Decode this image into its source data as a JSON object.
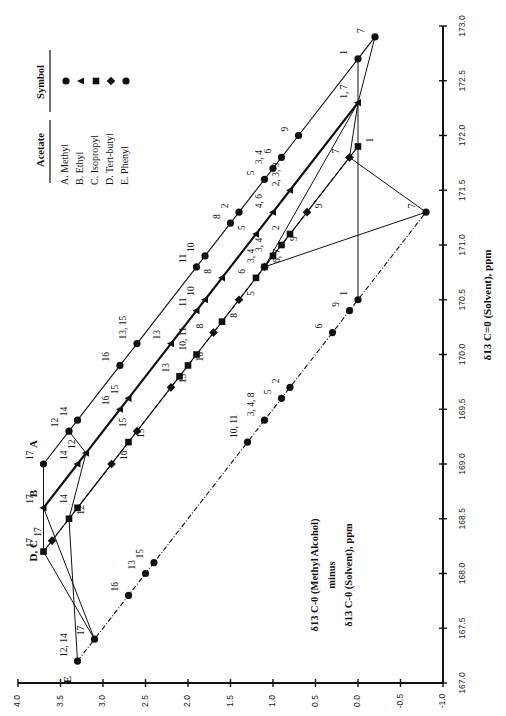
{
  "chart_data": {
    "type": "scatter",
    "orientation": "rotated-90-ccw",
    "title": "",
    "xlabel": "δ13 C=0 (Solvent), ppm",
    "ylabel": "δ13 C=0 (Methyl Alcohol) minus δ13 C=0 (Solvent), ppm",
    "xlim": [
      167.0,
      173.0
    ],
    "ylim": [
      -1.0,
      4.0
    ],
    "x_ticks": [
      "167.0",
      "167.5",
      "168.0",
      "168.5",
      "169.0",
      "169.5",
      "170.0",
      "170.5",
      "171.0",
      "171.5",
      "172.0",
      "172.5",
      "173.0"
    ],
    "y_ticks": [
      "4.0",
      "3.5",
      "3.0",
      "2.5",
      "2.0",
      "1.5",
      "1.0",
      "0.5",
      "0.0",
      "-0.5",
      "-1.0"
    ],
    "grid": false,
    "legend": {
      "position": "top-left",
      "headers": [
        "Acetate",
        "Symbol"
      ],
      "entries": [
        {
          "label": "A. Methyl",
          "symbol": "circle"
        },
        {
          "label": "B.  Ethyl",
          "symbol": "triangle"
        },
        {
          "label": "C. Isopropyl",
          "symbol": "square"
        },
        {
          "label": "D. Tert-butyl",
          "symbol": "diamond"
        },
        {
          "label": "E. Phenyl",
          "symbol": "circle"
        }
      ]
    },
    "annotation": {
      "line1": "δ13 C-0 (Methyl Alcohol)",
      "line2": "minus",
      "line3": "δ13 C-0 (Solvent), ppm"
    },
    "series": [
      {
        "name": "A. Methyl",
        "letter": "A",
        "symbol": "circle",
        "style": "solid",
        "points": [
          {
            "x": 169.0,
            "y": 3.7,
            "label": "17"
          },
          {
            "x": 169.3,
            "y": 3.4,
            "label": "12"
          },
          {
            "x": 169.4,
            "y": 3.3,
            "label": "14"
          },
          {
            "x": 169.9,
            "y": 2.8,
            "label": "16"
          },
          {
            "x": 170.1,
            "y": 2.6,
            "label": "13, 15"
          },
          {
            "x": 170.8,
            "y": 1.9,
            "label": "11"
          },
          {
            "x": 170.9,
            "y": 1.8,
            "label": "10"
          },
          {
            "x": 171.2,
            "y": 1.5,
            "label": "8"
          },
          {
            "x": 171.3,
            "y": 1.4,
            "label": "2"
          },
          {
            "x": 171.6,
            "y": 1.1,
            "label": "5"
          },
          {
            "x": 171.7,
            "y": 1.0,
            "label": "3, 4"
          },
          {
            "x": 171.8,
            "y": 0.9,
            "label": "6"
          },
          {
            "x": 172.0,
            "y": 0.7,
            "label": "9"
          },
          {
            "x": 172.7,
            "y": 0.0,
            "label": "1"
          },
          {
            "x": 172.9,
            "y": -0.2,
            "label": "7"
          }
        ]
      },
      {
        "name": "B. Ethyl",
        "letter": "B",
        "symbol": "triangle",
        "style": "thick",
        "points": [
          {
            "x": 168.6,
            "y": 3.7,
            "label": "17"
          },
          {
            "x": 169.0,
            "y": 3.3,
            "label": "14"
          },
          {
            "x": 169.1,
            "y": 3.2,
            "label": "12"
          },
          {
            "x": 169.5,
            "y": 2.8,
            "label": "16"
          },
          {
            "x": 169.6,
            "y": 2.7,
            "label": "15"
          },
          {
            "x": 170.1,
            "y": 2.2,
            "label": "13"
          },
          {
            "x": 170.4,
            "y": 1.9,
            "label": "11"
          },
          {
            "x": 170.5,
            "y": 1.8,
            "label": "10"
          },
          {
            "x": 170.7,
            "y": 1.6,
            "label": "8"
          },
          {
            "x": 171.1,
            "y": 1.2,
            "label": "5"
          },
          {
            "x": 171.3,
            "y": 1.0,
            "label": "4, 6"
          },
          {
            "x": 171.5,
            "y": 0.8,
            "label": "2, 3, 9"
          },
          {
            "x": 172.3,
            "y": 0.0,
            "label": "1, 7"
          }
        ]
      },
      {
        "name": "C. Isopropyl",
        "letter": "C",
        "symbol": "square",
        "style": "solid",
        "points": [
          {
            "x": 168.2,
            "y": 3.7,
            "label": "17"
          },
          {
            "x": 168.5,
            "y": 3.4,
            "label": "12"
          },
          {
            "x": 168.6,
            "y": 3.3,
            "label": "14"
          },
          {
            "x": 169.2,
            "y": 2.7,
            "label": "15"
          },
          {
            "x": 169.8,
            "y": 2.1,
            "label": "13"
          },
          {
            "x": 169.9,
            "y": 2.0,
            "label": "16"
          },
          {
            "x": 170.0,
            "y": 1.9,
            "label": "10, 11"
          },
          {
            "x": 170.3,
            "y": 1.6,
            "label": "8"
          },
          {
            "x": 170.7,
            "y": 1.2,
            "label": "6"
          },
          {
            "x": 170.8,
            "y": 1.1,
            "label": "6, 7"
          },
          {
            "x": 170.9,
            "y": 1.0,
            "label": "3, 4"
          },
          {
            "x": 171.0,
            "y": 0.9,
            "label": "9"
          },
          {
            "x": 171.1,
            "y": 0.8,
            "label": "2"
          },
          {
            "x": 171.9,
            "y": 0.0,
            "label": "1"
          }
        ]
      },
      {
        "name": "D. Tert-butyl",
        "letter": "D",
        "symbol": "diamond",
        "style": "dashed",
        "points": [
          {
            "x": 168.3,
            "y": 3.6,
            "label": "17"
          },
          {
            "x": 169.0,
            "y": 2.9,
            "label": "16"
          },
          {
            "x": 169.3,
            "y": 2.6,
            "label": "15"
          },
          {
            "x": 169.7,
            "y": 2.2,
            "label": "13"
          },
          {
            "x": 170.2,
            "y": 1.7,
            "label": "8"
          },
          {
            "x": 170.5,
            "y": 1.4,
            "label": "5"
          },
          {
            "x": 170.8,
            "y": 1.1,
            "label": "3, 4"
          },
          {
            "x": 171.3,
            "y": 0.6,
            "label": "9"
          },
          {
            "x": 171.8,
            "y": 0.1,
            "label": "7"
          }
        ]
      },
      {
        "name": "E. Phenyl",
        "letter": "E",
        "symbol": "circle",
        "style": "dashdot",
        "points": [
          {
            "x": 167.2,
            "y": 3.3,
            "label": "12, 14"
          },
          {
            "x": 167.4,
            "y": 3.1,
            "label": "17"
          },
          {
            "x": 167.8,
            "y": 2.7,
            "label": "16"
          },
          {
            "x": 168.0,
            "y": 2.5,
            "label": "13"
          },
          {
            "x": 168.1,
            "y": 2.4,
            "label": "15"
          },
          {
            "x": 169.2,
            "y": 1.3,
            "label": "10, 11"
          },
          {
            "x": 169.4,
            "y": 1.1,
            "label": "3, 4, 8"
          },
          {
            "x": 169.6,
            "y": 0.9,
            "label": "5"
          },
          {
            "x": 169.7,
            "y": 0.8,
            "label": "2"
          },
          {
            "x": 170.2,
            "y": 0.3,
            "label": "6"
          },
          {
            "x": 170.4,
            "y": 0.1,
            "label": "9"
          },
          {
            "x": 170.5,
            "y": 0.0,
            "label": "1"
          },
          {
            "x": 171.3,
            "y": -0.8,
            "label": "7"
          }
        ]
      }
    ],
    "connectors": [
      {
        "from": [
          169.0,
          3.7
        ],
        "to": [
          168.6,
          3.7
        ]
      },
      {
        "from": [
          168.6,
          3.7
        ],
        "to": [
          168.2,
          3.7
        ]
      },
      {
        "from": [
          169.3,
          3.4
        ],
        "to": [
          169.1,
          3.2
        ]
      },
      {
        "from": [
          169.1,
          3.2
        ],
        "to": [
          168.5,
          3.4
        ]
      },
      {
        "from": [
          168.5,
          3.4
        ],
        "to": [
          167.2,
          3.3
        ]
      },
      {
        "from": [
          168.6,
          3.7
        ],
        "to": [
          167.4,
          3.1
        ]
      },
      {
        "from": [
          168.2,
          3.7
        ],
        "to": [
          167.4,
          3.1
        ]
      },
      {
        "from": [
          168.6,
          3.3
        ],
        "to": [
          169.0,
          2.9
        ]
      },
      {
        "from": [
          172.7,
          0.0
        ],
        "to": [
          172.3,
          0.0
        ]
      },
      {
        "from": [
          172.9,
          -0.2
        ],
        "to": [
          172.3,
          0.0
        ]
      },
      {
        "from": [
          172.3,
          0.0
        ],
        "to": [
          170.5,
          0.0
        ]
      },
      {
        "from": [
          172.3,
          0.0
        ],
        "to": [
          171.8,
          0.1
        ]
      },
      {
        "from": [
          172.3,
          0.0
        ],
        "to": [
          170.8,
          1.1
        ]
      },
      {
        "from": [
          171.8,
          0.1
        ],
        "to": [
          171.3,
          -0.8
        ]
      },
      {
        "from": [
          170.8,
          1.1
        ],
        "to": [
          171.3,
          -0.8
        ]
      }
    ]
  }
}
